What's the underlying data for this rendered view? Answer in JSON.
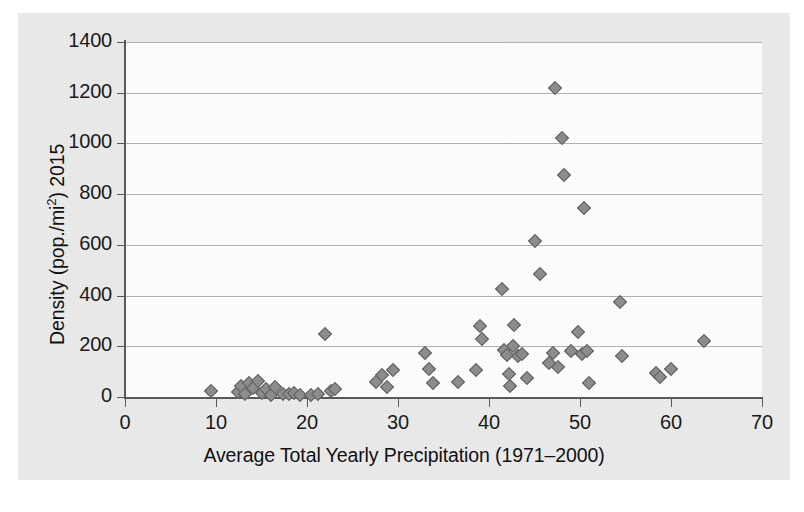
{
  "chart_data": {
    "type": "scatter",
    "title": "",
    "xlabel": "Average Total Yearly Precipitation (1971–2000)",
    "ylabel": "Density (pop./mi²) 2015",
    "ylabel_parts": {
      "prefix": "Density (pop./mi",
      "sup": "2",
      "suffix": ") 2015"
    },
    "xlim": [
      0,
      70
    ],
    "ylim": [
      0,
      1400
    ],
    "xticks": [
      0,
      10,
      20,
      30,
      40,
      50,
      60,
      70
    ],
    "yticks": [
      0,
      200,
      400,
      600,
      800,
      1000,
      1200,
      1400
    ],
    "grid": "horizontal",
    "legend": "none",
    "marker": "diamond",
    "marker_color": "#8d8d8d",
    "marker_edge_color": "#5d5d5d",
    "series": [
      {
        "name": "US states",
        "points": [
          [
            9.5,
            25
          ],
          [
            12.4,
            20
          ],
          [
            12.8,
            45
          ],
          [
            13.2,
            10
          ],
          [
            13.6,
            55
          ],
          [
            14.1,
            35
          ],
          [
            14.6,
            65
          ],
          [
            15.1,
            15
          ],
          [
            15.5,
            30
          ],
          [
            16.0,
            8
          ],
          [
            16.5,
            40
          ],
          [
            17.4,
            12
          ],
          [
            18.0,
            10
          ],
          [
            18.6,
            14
          ],
          [
            19.2,
            8
          ],
          [
            20.4,
            6
          ],
          [
            21.2,
            10
          ],
          [
            22.0,
            250
          ],
          [
            22.6,
            22
          ],
          [
            23.1,
            30
          ],
          [
            27.6,
            60
          ],
          [
            28.2,
            85
          ],
          [
            28.8,
            40
          ],
          [
            29.4,
            105
          ],
          [
            33.0,
            175
          ],
          [
            33.4,
            110
          ],
          [
            33.9,
            55
          ],
          [
            36.6,
            60
          ],
          [
            38.6,
            105
          ],
          [
            39.0,
            280
          ],
          [
            39.2,
            230
          ],
          [
            41.4,
            425
          ],
          [
            41.6,
            185
          ],
          [
            42.0,
            165
          ],
          [
            42.2,
            90
          ],
          [
            42.3,
            45
          ],
          [
            42.6,
            200
          ],
          [
            42.8,
            285
          ],
          [
            43.2,
            160
          ],
          [
            43.6,
            170
          ],
          [
            44.2,
            75
          ],
          [
            45.0,
            615
          ],
          [
            45.6,
            485
          ],
          [
            46.6,
            135
          ],
          [
            47.0,
            175
          ],
          [
            47.3,
            1220
          ],
          [
            47.6,
            120
          ],
          [
            48.0,
            1020
          ],
          [
            48.2,
            875
          ],
          [
            49.0,
            180
          ],
          [
            49.8,
            255
          ],
          [
            50.2,
            170
          ],
          [
            50.4,
            745
          ],
          [
            50.8,
            180
          ],
          [
            51.0,
            55
          ],
          [
            54.4,
            375
          ],
          [
            54.6,
            160
          ],
          [
            58.4,
            95
          ],
          [
            58.8,
            80
          ],
          [
            60.0,
            110
          ],
          [
            63.6,
            220
          ]
        ]
      }
    ]
  }
}
